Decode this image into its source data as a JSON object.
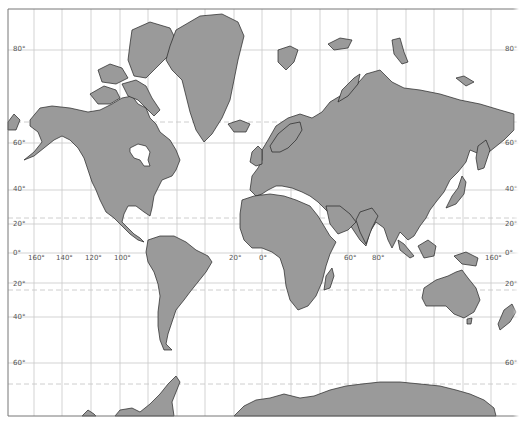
{
  "map": {
    "projection": "Mercator",
    "colors": {
      "land": "#9a9a9a",
      "coast": "#222222",
      "grid": "#c8c8c8",
      "dashed": "#c8c8c8",
      "frame": "#777777",
      "background": "#ffffff"
    },
    "frame": {
      "left": 8,
      "top": 9,
      "right": 519,
      "bottom": 416
    },
    "meridians_x": [
      34,
      62,
      91,
      120,
      148,
      177,
      205,
      234,
      262,
      291,
      320,
      348,
      377,
      406,
      434,
      463,
      491
    ],
    "parallels": [
      {
        "y": 50,
        "label": "80°"
      },
      {
        "y": 143,
        "label": "60°"
      },
      {
        "y": 190,
        "label": "40°"
      },
      {
        "y": 224,
        "label": "20°"
      },
      {
        "y": 253,
        "label": "0°"
      },
      {
        "y": 283,
        "label": "20°"
      },
      {
        "y": 317,
        "label": "40°"
      },
      {
        "y": 363,
        "label": "60°"
      }
    ],
    "dashed_lines": [
      {
        "name": "arctic-circle",
        "y": 122
      },
      {
        "name": "tropic-of-cancer",
        "y": 218
      },
      {
        "name": "tropic-of-capricorn",
        "y": 290
      },
      {
        "name": "antarctic-circle",
        "y": 384
      }
    ],
    "lat_labels_left": [
      {
        "text": "80°",
        "x": 13,
        "y": 46
      },
      {
        "text": "60°",
        "x": 13,
        "y": 140
      },
      {
        "text": "40°",
        "x": 13,
        "y": 186
      },
      {
        "text": "20°",
        "x": 13,
        "y": 221
      },
      {
        "text": "0°",
        "x": 13,
        "y": 250
      },
      {
        "text": "20°",
        "x": 13,
        "y": 281
      },
      {
        "text": "40°",
        "x": 13,
        "y": 314
      },
      {
        "text": "60°",
        "x": 13,
        "y": 360
      }
    ],
    "lat_labels_right": [
      {
        "text": "80°",
        "x": 505,
        "y": 46
      },
      {
        "text": "60°",
        "x": 505,
        "y": 140
      },
      {
        "text": "40°",
        "x": 505,
        "y": 186
      },
      {
        "text": "20°",
        "x": 505,
        "y": 221
      },
      {
        "text": "0°",
        "x": 505,
        "y": 250
      },
      {
        "text": "20°",
        "x": 505,
        "y": 281
      },
      {
        "text": "60°",
        "x": 505,
        "y": 360
      }
    ],
    "lon_labels": [
      {
        "text": "160°",
        "x": 28,
        "y": 255
      },
      {
        "text": "140°",
        "x": 56,
        "y": 255
      },
      {
        "text": "120°",
        "x": 85,
        "y": 255
      },
      {
        "text": "100°",
        "x": 114,
        "y": 255
      },
      {
        "text": "20°",
        "x": 229,
        "y": 255
      },
      {
        "text": "0°",
        "x": 259,
        "y": 255
      },
      {
        "text": "60°",
        "x": 344,
        "y": 255
      },
      {
        "text": "80°",
        "x": 372,
        "y": 255
      },
      {
        "text": "160°",
        "x": 485,
        "y": 255
      }
    ],
    "landmasses": [
      {
        "name": "north-america",
        "d": "M30,120 L40,108 L52,106 L70,108 L88,112 L100,110 L112,104 L122,98 L132,96 L138,104 L146,108 L150,118 L156,124 L160,132 L170,140 L176,150 L180,160 L176,170 L172,176 L162,180 L158,188 L154,196 L152,208 L150,216 L144,212 L136,206 L128,206 L124,214 L122,222 L128,228 L134,234 L140,238 L144,242 L138,240 L130,234 L122,226 L114,218 L106,212 L100,200 L96,190 L92,182 L88,170 L84,158 L78,148 L70,140 L62,136 L54,140 L44,148 L34,156 L24,160 L34,152 L42,142 L38,132 L30,126 Z"
      },
      {
        "name": "hudson-bay",
        "d": "M130,148 L138,144 L146,146 L150,152 L148,160 L150,166 L144,166 L140,160 L134,158 L130,152 Z",
        "water": true
      },
      {
        "name": "arctic-archipelago-1",
        "d": "M90,94 L104,86 L116,90 L120,98 L110,104 L98,104 Z"
      },
      {
        "name": "arctic-archipelago-2",
        "d": "M122,84 L136,80 L146,86 L152,98 L160,110 L154,116 L146,108 L138,100 L128,96 Z"
      },
      {
        "name": "arctic-archipelago-3",
        "d": "M132,30 L150,22 L170,28 L176,40 L170,54 L158,66 L146,78 L134,76 L128,60 L130,44 Z"
      },
      {
        "name": "arctic-archipelago-4",
        "d": "M98,70 L110,64 L122,68 L128,78 L116,84 L102,82 Z"
      },
      {
        "name": "greenland",
        "d": "M176,30 L200,16 L222,14 L238,22 L244,36 L238,60 L234,80 L230,100 L222,118 L212,134 L204,142 L196,130 L190,112 L186,96 L182,80 L172,70 L166,60 L170,46 Z"
      },
      {
        "name": "iceland",
        "d": "M228,124 L240,120 L250,124 L246,132 L234,132 Z"
      },
      {
        "name": "south-america",
        "d": "M148,240 L160,236 L174,236 L186,242 L196,250 L208,256 L212,262 L206,272 L198,282 L190,292 L184,300 L176,310 L172,322 L168,334 L166,344 L172,350 L164,350 L160,340 L158,326 L158,312 L160,296 L158,284 L154,272 L148,262 L146,252 Z"
      },
      {
        "name": "eurasia",
        "d": "M262,150 L268,140 L276,126 L288,118 L300,114 L312,118 L322,112 L330,102 L340,96 L352,90 L366,74 L380,70 L392,82 L404,88 L420,90 L440,94 L460,100 L480,104 L500,110 L514,114 L514,130 L504,140 L494,148 L484,156 L470,150 L466,162 L458,172 L450,180 L444,192 L436,202 L430,210 L426,218 L420,226 L414,236 L408,240 L400,232 L396,240 L392,248 L388,240 L384,228 L376,222 L370,232 L366,246 L360,240 L352,228 L346,218 L340,212 L332,216 L326,210 L318,202 L310,196 L302,192 L292,188 L282,186 L276,186 L268,190 L262,194 L256,196 L250,190 L252,176 L258,168 L262,160 Z"
      },
      {
        "name": "scandinavia",
        "d": "M270,146 L278,134 L290,124 L300,122 L302,130 L296,140 L288,148 L280,152 L272,152 Z"
      },
      {
        "name": "uk",
        "d": "M252,152 L258,146 L262,150 L262,164 L256,166 L250,162 Z"
      },
      {
        "name": "africa",
        "d": "M242,200 L254,196 L270,194 L284,196 L296,200 L310,206 L318,216 L324,226 L330,236 L336,242 L330,254 L326,266 L322,282 L316,296 L308,306 L298,310 L290,300 L286,286 L284,270 L280,258 L272,252 L262,248 L252,248 L244,240 L240,228 L240,214 Z"
      },
      {
        "name": "madagascar",
        "d": "M326,276 L332,268 L334,276 L330,288 L324,290 Z"
      },
      {
        "name": "arabia",
        "d": "M326,206 L340,206 L350,214 L356,222 L348,230 L338,234 L330,224 Z"
      },
      {
        "name": "india",
        "d": "M360,212 L372,208 L378,216 L372,228 L366,244 L360,232 L356,220 Z"
      },
      {
        "name": "kamchatka",
        "d": "M478,146 L486,140 L490,150 L484,168 L478,170 L476,158 Z"
      },
      {
        "name": "japan",
        "d": "M452,196 L458,188 L462,176 L466,182 L464,194 L456,204 L446,208 Z"
      },
      {
        "name": "borneo",
        "d": "M418,246 L428,240 L436,246 L434,256 L424,258 Z"
      },
      {
        "name": "sumatra",
        "d": "M398,240 L404,244 L414,256 L410,258 L400,250 Z"
      },
      {
        "name": "new-guinea",
        "d": "M454,256 L466,252 L478,258 L476,266 L462,264 Z"
      },
      {
        "name": "australia",
        "d": "M424,288 L436,280 L448,276 L456,272 L462,270 L468,278 L476,288 L480,300 L474,312 L464,318 L454,314 L446,306 L436,306 L426,306 L422,298 Z"
      },
      {
        "name": "tasmania",
        "d": "M467,319 L472,318 L471,324 L467,324 Z"
      },
      {
        "name": "new-zealand",
        "d": "M504,310 L512,304 L516,312 L510,322 L500,330 L498,324 Z"
      },
      {
        "name": "svalbard",
        "d": "M278,50 L290,46 L298,50 L294,62 L286,70 L278,62 Z"
      },
      {
        "name": "franz-josef",
        "d": "M328,44 L340,38 L352,40 L348,48 L334,50 Z"
      },
      {
        "name": "novaya-zemlya",
        "d": "M342,90 L354,78 L360,74 L358,84 L348,96 L338,102 Z"
      },
      {
        "name": "severnaya-zemlya",
        "d": "M392,40 L400,38 L404,52 L408,62 L402,64 L394,54 Z"
      },
      {
        "name": "new-siberian",
        "d": "M456,78 L464,76 L474,82 L466,86 Z"
      },
      {
        "name": "antarctica-west",
        "d": "M115,416 L120,410 L132,408 L140,412 L150,404 L160,394 L168,384 L176,376 L180,382 L176,392 L172,402 L174,416 Z"
      },
      {
        "name": "antarctica-small",
        "d": "M82,416 L88,410 L94,414 L96,416 Z"
      },
      {
        "name": "antarctica-east",
        "d": "M234,416 L244,406 L256,400 L270,398 L284,394 L300,398 L314,396 L330,390 L346,386 L362,384 L380,382 L400,382 L420,384 L440,386 L456,390 L470,394 L484,400 L494,408 L496,416 Z"
      },
      {
        "name": "chukotka",
        "d": "M8,122 L14,114 L20,120 L16,130 L8,130 Z"
      }
    ]
  }
}
